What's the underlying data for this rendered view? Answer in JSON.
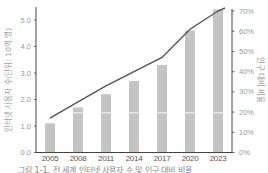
{
  "chart_data": {
    "type": "bar",
    "title": "",
    "categories": [
      "2005",
      "2008",
      "2011",
      "2014",
      "2017",
      "2020",
      "2023"
    ],
    "series": [
      {
        "name": "인터넷 사용자 수",
        "kind": "bar",
        "axis": "left",
        "values": [
          1.1,
          1.7,
          2.2,
          2.7,
          3.3,
          4.6,
          5.4
        ],
        "color": "#c4c4c4"
      },
      {
        "name": "인구 대비 비율",
        "kind": "line",
        "axis": "right",
        "values": [
          17,
          25,
          33,
          40,
          47,
          61,
          70
        ],
        "color": "#555555"
      }
    ],
    "ylabel": "인터넷 사용자 수(단위: 10억 명)",
    "y2label": "인구 대비 비율",
    "ylim": [
      0,
      5.5
    ],
    "y2lim": [
      0,
      70
    ],
    "yticks": [
      "0.0",
      "1.0",
      "2.0",
      "3.0",
      "4.0",
      "5.0"
    ],
    "y2ticks": [
      "0%",
      "10%",
      "20%",
      "30%",
      "40%",
      "50%",
      "60%",
      "70%"
    ],
    "bar_divider_value": 1.5,
    "grid": false,
    "legend": "none"
  },
  "caption": "그림 1-1. 전 세계 인터넷 사용자 수 및 인구 대비 비율"
}
